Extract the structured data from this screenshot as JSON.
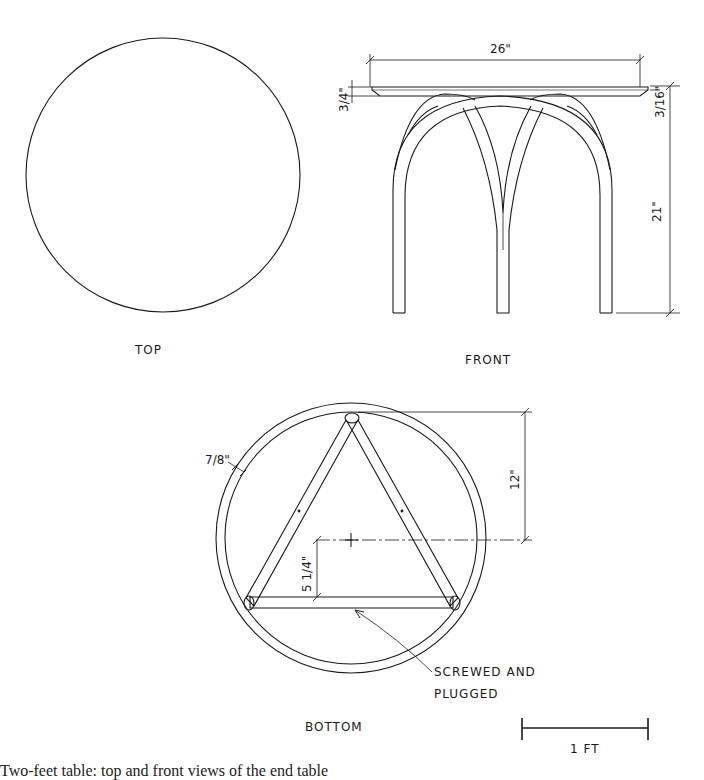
{
  "views": {
    "top": {
      "label": "TOP"
    },
    "front": {
      "label": "FRONT",
      "dimensions": {
        "width": "26\"",
        "top_thickness": "3/4\"",
        "edge_bevel": "3/16\"",
        "height": "21\""
      }
    },
    "bottom": {
      "label": "BOTTOM",
      "dimensions": {
        "rim_width": "7/8\"",
        "vertex_to_center": "12\"",
        "center_to_rail": "5 1/4\""
      },
      "note_line1": "SCREWED AND",
      "note_line2": "PLUGGED"
    }
  },
  "scale_bar": {
    "label": "1 FT"
  },
  "caption": "Two-feet table: top and front views of the end table"
}
